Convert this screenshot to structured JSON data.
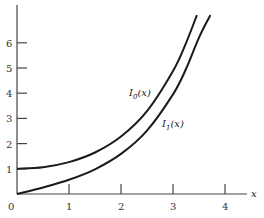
{
  "chart_data": {
    "type": "line",
    "title": "",
    "xlabel": "x",
    "ylabel": "",
    "xlim": [
      0,
      4.3
    ],
    "ylim": [
      0,
      7.5
    ],
    "x_ticks": [
      "0",
      "1",
      "2",
      "3",
      "4"
    ],
    "y_ticks": [
      "1",
      "2",
      "3",
      "4",
      "5",
      "6"
    ],
    "grid": false,
    "legend": "inline labels",
    "series": [
      {
        "name": "I0(x)",
        "label_main": "I",
        "label_sub": "0",
        "label_arg": "(x)",
        "x": [
          0,
          0.5,
          1,
          1.5,
          2,
          2.5,
          3,
          3.25,
          3.46
        ],
        "values": [
          1.0,
          1.063,
          1.266,
          1.647,
          2.28,
          3.29,
          4.881,
          5.99,
          7.1
        ]
      },
      {
        "name": "I1(x)",
        "label_main": "I",
        "label_sub": "1",
        "label_arg": "(x)",
        "x": [
          0,
          0.5,
          1,
          1.5,
          2,
          2.5,
          3,
          3.25,
          3.5,
          3.72
        ],
        "values": [
          0.0,
          0.258,
          0.565,
          0.982,
          1.591,
          2.517,
          3.953,
          4.96,
          6.206,
          7.1
        ]
      }
    ]
  }
}
